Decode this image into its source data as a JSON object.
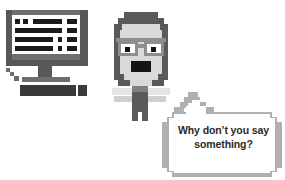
{
  "scene": {
    "title": "Person at computer with speech bubble",
    "background_color": "#ffffff",
    "width": 285,
    "height": 180
  },
  "computer": {
    "name": "desktop-computer",
    "monitor_label": "monitor",
    "screen_label": "screen",
    "keyboard_label": "keyboard",
    "mouse_label": "mouse",
    "stand_label": "monitor-stand",
    "cursor_label": "mouse-cursor",
    "frame_color": "#58585a",
    "bezel_color": "#6e6e70",
    "screen_color": "#ffffff",
    "text_bar_color": "#1b1b1b",
    "screen_lines": [
      {
        "row": 0,
        "segments": [
          {
            "x": 3,
            "w": 5
          },
          {
            "x": 11,
            "w": 5
          },
          {
            "x": 21,
            "w": 29
          },
          {
            "x": 55,
            "w": 10
          }
        ]
      },
      {
        "row": 1,
        "segments": [
          {
            "x": 3,
            "w": 47
          },
          {
            "x": 55,
            "w": 10
          }
        ]
      },
      {
        "row": 2,
        "segments": [
          {
            "x": 3,
            "w": 38
          },
          {
            "x": 46,
            "w": 4
          },
          {
            "x": 55,
            "w": 10
          }
        ]
      },
      {
        "row": 3,
        "segments": [
          {
            "x": 3,
            "w": 38
          },
          {
            "x": 46,
            "w": 4
          },
          {
            "x": 55,
            "w": 10
          }
        ]
      }
    ]
  },
  "person": {
    "name": "person-with-glasses",
    "hair_label": "hair",
    "face_label": "face",
    "glasses_label": "glasses",
    "left_lens_label": "left-lens",
    "right_lens_label": "right-lens",
    "mouth_label": "open-mouth",
    "neck_label": "neck",
    "torso_label": "torso",
    "left_arm_label": "left-arm",
    "right_arm_label": "right-arm",
    "hair_color": "#5a5a5c",
    "skin_color": "#d9d9d9",
    "mouth_color": "#141414",
    "glasses_color": "#8e8e90",
    "shirt_color": "#5a5a5c"
  },
  "bubble": {
    "name": "speech-bubble",
    "text": "Why don’t you say\nsomething?",
    "tail_label": "speech-bubble-tail",
    "border_color": "#b0b0b0",
    "fill_color": "#ffffff",
    "text_color": "#2a2a2a"
  }
}
